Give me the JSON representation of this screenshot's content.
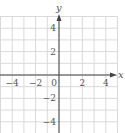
{
  "chart_data": {
    "type": "scatter",
    "title": "",
    "xlabel": "x",
    "ylabel": "y",
    "xlim": [
      -5,
      5
    ],
    "ylim": [
      -5,
      5
    ],
    "grid": true,
    "grid_step": 1,
    "x_ticks": [
      {
        "value": -4,
        "label": "−4"
      },
      {
        "value": -2,
        "label": "−2"
      },
      {
        "value": 0,
        "label": "0"
      },
      {
        "value": 2,
        "label": "2"
      },
      {
        "value": 4,
        "label": "4"
      }
    ],
    "y_ticks": [
      {
        "value": 4,
        "label": "4"
      },
      {
        "value": 2,
        "label": "2"
      },
      {
        "value": -2,
        "label": "−2"
      },
      {
        "value": -4,
        "label": "−4"
      }
    ],
    "series": [],
    "colors": {
      "grid": "#d9d9d9",
      "axis": "#444444",
      "text": "#555555"
    }
  }
}
